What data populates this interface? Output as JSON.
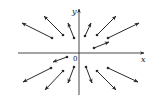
{
  "diagram": {
    "type": "vector-field",
    "axes": {
      "x_label": "x",
      "y_label": "y",
      "origin_label": "0"
    },
    "colors": {
      "axis": "#333333",
      "arrow": "#2a2a2a",
      "background": "#ffffff"
    },
    "arrows": [
      {
        "quadrant": "upper-left",
        "from": [
          52,
          38
        ],
        "to": [
          22,
          23
        ]
      },
      {
        "quadrant": "upper-left",
        "from": [
          63,
          35
        ],
        "to": [
          44,
          16
        ]
      },
      {
        "quadrant": "upper-left",
        "from": [
          74,
          38
        ],
        "to": [
          68,
          23
        ]
      },
      {
        "quadrant": "upper-right",
        "from": [
          85,
          36
        ],
        "to": [
          91,
          23
        ]
      },
      {
        "quadrant": "upper-right",
        "from": [
          97,
          35
        ],
        "to": [
          116,
          16
        ]
      },
      {
        "quadrant": "upper-right",
        "from": [
          108,
          38
        ],
        "to": [
          139,
          23
        ]
      },
      {
        "quadrant": "upper-right",
        "from": [
          94,
          48
        ],
        "to": [
          109,
          42
        ]
      },
      {
        "quadrant": "lower-left",
        "from": [
          67,
          57
        ],
        "to": [
          53,
          62
        ]
      },
      {
        "quadrant": "lower-left",
        "from": [
          51,
          68
        ],
        "to": [
          23,
          82
        ]
      },
      {
        "quadrant": "lower-left",
        "from": [
          63,
          71
        ],
        "to": [
          45,
          90
        ]
      },
      {
        "quadrant": "lower-left",
        "from": [
          74,
          67
        ],
        "to": [
          68,
          83
        ]
      },
      {
        "quadrant": "lower-right",
        "from": [
          86,
          67
        ],
        "to": [
          92,
          83
        ]
      },
      {
        "quadrant": "lower-right",
        "from": [
          97,
          71
        ],
        "to": [
          116,
          90
        ]
      },
      {
        "quadrant": "lower-right",
        "from": [
          108,
          68
        ],
        "to": [
          138,
          82
        ]
      }
    ]
  }
}
